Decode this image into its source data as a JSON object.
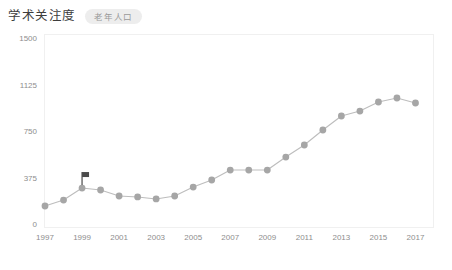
{
  "header": {
    "title": "学术关注度",
    "series_chip": "老年人口"
  },
  "chart_data": {
    "type": "line",
    "title": "学术关注度",
    "xlabel": "",
    "ylabel": "",
    "grid": false,
    "legend_position": "top",
    "legend": [
      "老年人口"
    ],
    "ylim": [
      0,
      1500
    ],
    "yticks": [
      0,
      375,
      750,
      1125,
      1500
    ],
    "ytick_labels": [
      "0",
      "375",
      "750",
      "1125",
      "1500"
    ],
    "xlim": [
      1997,
      2018
    ],
    "xticks": [
      1997,
      1999,
      2001,
      2003,
      2005,
      2007,
      2009,
      2011,
      2013,
      2015,
      2017
    ],
    "xtick_labels": [
      "1997",
      "1999",
      "2001",
      "2003",
      "2005",
      "2007",
      "2009",
      "2011",
      "2013",
      "2015",
      "2017"
    ],
    "x": [
      1997,
      1998,
      1999,
      2000,
      2001,
      2002,
      2003,
      2004,
      2005,
      2006,
      2007,
      2008,
      2009,
      2010,
      2011,
      2012,
      2013,
      2014,
      2015,
      2016,
      2017
    ],
    "series": [
      {
        "name": "老年人口",
        "color": "#a6a6a6",
        "values": [
          145,
          193,
          290,
          274,
          226,
          218,
          202,
          226,
          298,
          355,
          435,
          435,
          435,
          540,
          637,
          758,
          871,
          911,
          984,
          1016,
          976
        ]
      }
    ],
    "annotations": [
      {
        "name": "flag-marker",
        "x": 1999,
        "y": 290,
        "label": ""
      }
    ]
  }
}
